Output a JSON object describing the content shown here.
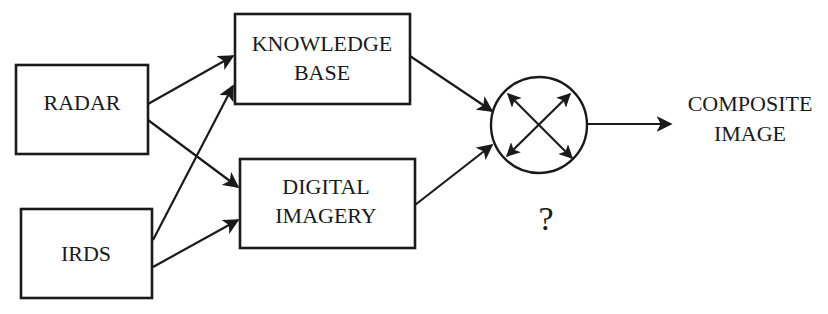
{
  "diagram": {
    "type": "data-fusion block diagram",
    "nodes": {
      "radar": {
        "label": "RADAR"
      },
      "irds": {
        "label": "IRDS"
      },
      "knowledge_base": {
        "line1": "KNOWLEDGE",
        "line2": "BASE"
      },
      "digital_imagery": {
        "line1": "DIGITAL",
        "line2": "IMAGERY"
      },
      "fusion": {
        "symbol": "crossed-double-arrows-icon",
        "caption": "?"
      },
      "output": {
        "line1": "COMPOSITE",
        "line2": "IMAGE"
      }
    },
    "edges": [
      {
        "from": "RADAR",
        "to": "KNOWLEDGE BASE"
      },
      {
        "from": "RADAR",
        "to": "DIGITAL IMAGERY"
      },
      {
        "from": "IRDS",
        "to": "KNOWLEDGE BASE"
      },
      {
        "from": "IRDS",
        "to": "DIGITAL IMAGERY"
      },
      {
        "from": "KNOWLEDGE BASE",
        "to": "fusion"
      },
      {
        "from": "DIGITAL IMAGERY",
        "to": "fusion"
      },
      {
        "from": "fusion",
        "to": "COMPOSITE IMAGE"
      }
    ],
    "colors": {
      "ink": "#1a1a1a",
      "background": "#ffffff"
    }
  }
}
